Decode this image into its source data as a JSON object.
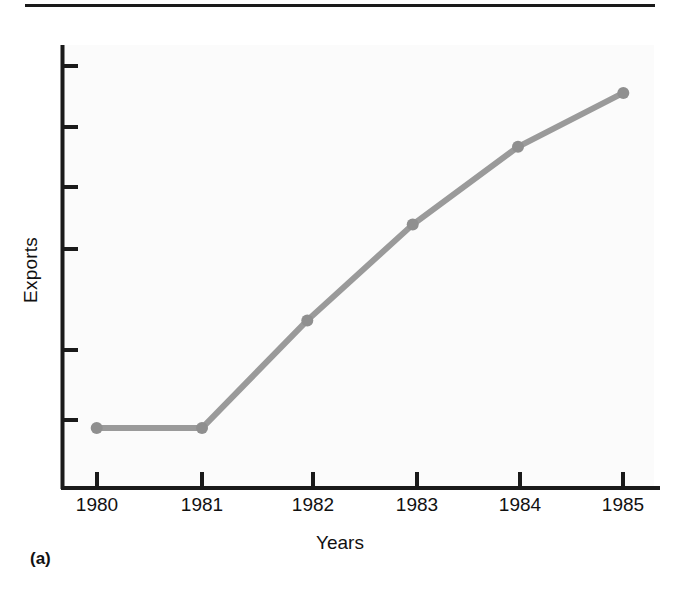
{
  "figure": {
    "panel_caption": "(a)",
    "line_color": "#9a9a9a",
    "marker_color": "#8f8f8f",
    "axis_color": "#1a1a1a",
    "background_color": "#ffffff",
    "plot_background_color": "#fbfbfb"
  },
  "chart_data": {
    "type": "line",
    "title": "",
    "subtitle": "",
    "xlabel": "Years",
    "ylabel": "Exports",
    "categories": [
      "1980",
      "1981",
      "1982",
      "1983",
      "1984",
      "1985"
    ],
    "x": [
      1980,
      1981,
      1982,
      1983,
      1984,
      1985
    ],
    "values": [
      1,
      1,
      2.8,
      4.4,
      5.7,
      6.6
    ],
    "series": [
      {
        "name": "Exports",
        "values": [
          1,
          1,
          2.8,
          4.4,
          5.7,
          6.6
        ]
      }
    ],
    "xlim": [
      1979.67,
      1985.33
    ],
    "ylim": [
      0,
      7.4
    ],
    "x_tick_labels": [
      "1980",
      "1981",
      "1982",
      "1983",
      "1984",
      "1985"
    ],
    "y_tick_labels": [
      "",
      "",
      "",
      "",
      "",
      ""
    ],
    "y_tick_values": [
      1,
      2,
      3,
      4,
      5,
      6
    ],
    "y_axis_numeric_labels_shown": false,
    "grid": false,
    "legend": false,
    "legend_position": "none",
    "markers": true,
    "marker_shape": "circle",
    "annotations": [
      "(a)"
    ]
  },
  "axes": {
    "y_title": "Exports",
    "x_title": "Years"
  }
}
